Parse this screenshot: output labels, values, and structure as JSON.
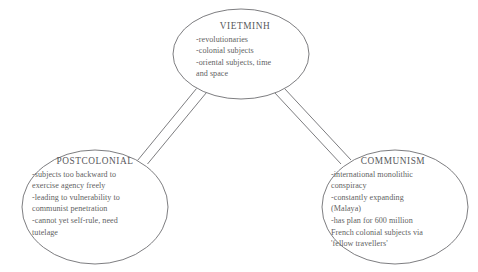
{
  "diagram": {
    "type": "concept-map",
    "stroke_color": "#6e6e72",
    "text_color": "#5f5f63",
    "background_color": "#ffffff",
    "nodes": [
      {
        "id": "vietminh",
        "title": "VIETMINH",
        "lines": [
          "-revolutionaries",
          "-colonial subjects",
          "-oriental subjects, time",
          "and space"
        ]
      },
      {
        "id": "postcolonial",
        "title": "POSTCOLONIAL",
        "lines": [
          "-subjects too backward to",
          "exercise agency freely",
          "-leading to vulnerability to",
          "communist penetration",
          "-cannot yet self-rule, need",
          "tutelage"
        ]
      },
      {
        "id": "communism",
        "title": "COMMUNISM",
        "lines": [
          "-international monolithic",
          "conspiracy",
          "-constantly expanding",
          "(Malaya)",
          "-has plan for 600 million",
          "French colonial subjects via",
          "'fellow travellers'"
        ]
      }
    ],
    "connectors": [
      {
        "id": "vietminh-postcolonial",
        "from": "vietminh",
        "to": "postcolonial",
        "style": "double-line"
      },
      {
        "id": "vietminh-communism",
        "from": "vietminh",
        "to": "communism",
        "style": "double-line"
      }
    ]
  }
}
